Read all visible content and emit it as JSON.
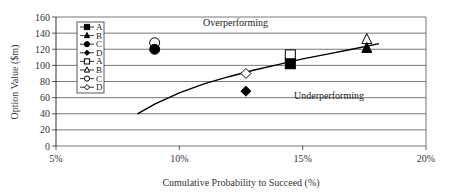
{
  "chart_data": {
    "type": "scatter",
    "title": "",
    "xlabel": "Cumulative Probability to Succeed (%)",
    "ylabel": "Option Value ($m)",
    "xlim": [
      5,
      20
    ],
    "ylim": [
      0,
      160
    ],
    "x_ticks": [
      "5%",
      "10%",
      "15%",
      "20%"
    ],
    "y_ticks": [
      "0",
      "20",
      "40",
      "60",
      "80",
      "100",
      "120",
      "140",
      "160"
    ],
    "grid": "horizontal",
    "legend_position": "upper-left inside",
    "annotations": [
      "Overperforming",
      "Underperforming"
    ],
    "series": [
      {
        "name": "A",
        "marker": "filled-square",
        "x": 14.5,
        "y": 102
      },
      {
        "name": "B",
        "marker": "filled-triangle",
        "x": 17.6,
        "y": 121
      },
      {
        "name": "C",
        "marker": "filled-circle",
        "x": 9.0,
        "y": 120
      },
      {
        "name": "D",
        "marker": "filled-diamond",
        "x": 12.7,
        "y": 68
      },
      {
        "name": "A",
        "marker": "open-square",
        "x": 14.5,
        "y": 113
      },
      {
        "name": "B",
        "marker": "open-triangle",
        "x": 17.6,
        "y": 132
      },
      {
        "name": "C",
        "marker": "open-circle",
        "x": 9.0,
        "y": 128
      },
      {
        "name": "D",
        "marker": "open-diamond",
        "x": 12.7,
        "y": 90
      }
    ],
    "curve": {
      "name": "threshold-curve",
      "x": [
        8.3,
        9.0,
        10.0,
        11.0,
        12.0,
        13.0,
        14.0,
        15.0,
        16.0,
        17.0,
        18.1
      ],
      "y": [
        40,
        52,
        66,
        77,
        86,
        94,
        101,
        108,
        114,
        120,
        127
      ]
    }
  },
  "legend": {
    "items": [
      {
        "label": "A",
        "marker": "filled-square"
      },
      {
        "label": "B",
        "marker": "filled-triangle"
      },
      {
        "label": "C",
        "marker": "filled-circle"
      },
      {
        "label": "D",
        "marker": "filled-diamond"
      },
      {
        "label": "A",
        "marker": "open-square"
      },
      {
        "label": "B",
        "marker": "open-triangle"
      },
      {
        "label": "C",
        "marker": "open-circle"
      },
      {
        "label": "D",
        "marker": "open-diamond"
      }
    ]
  },
  "colors": {
    "grid": "#555555",
    "marker": "#000000",
    "curve": "#000000"
  }
}
